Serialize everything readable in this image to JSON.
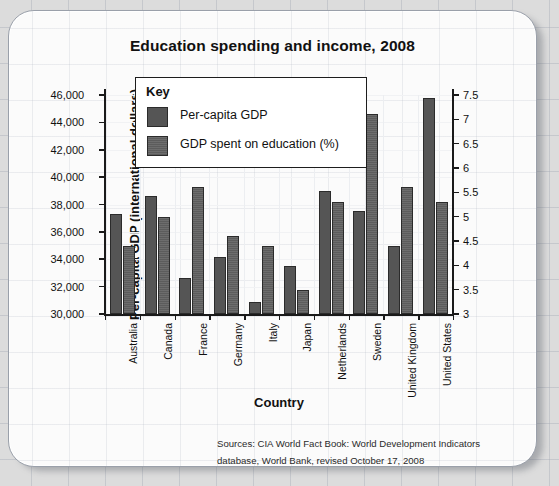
{
  "card": {
    "title": "Education spending and income, 2008"
  },
  "legend": {
    "title": "Key",
    "entries": [
      {
        "label": "Per-capita GDP",
        "swatch": "gdp",
        "color": "#555555"
      },
      {
        "label": "GDP spent on education (%)",
        "swatch": "edu",
        "color": "#5c5c5c"
      }
    ]
  },
  "sources": {
    "line1": "Sources: CIA World Fact Book: World Development Indicators",
    "line2": "database, World Bank, revised October 17, 2008"
  },
  "chart_data": {
    "type": "bar",
    "title": "Education spending and income, 2008",
    "xlabel": "Country",
    "ylabel": "Per-capita GDP (international dollars)",
    "y2label": "GDP spent on education (%)",
    "categories": [
      "Australia",
      "Canada",
      "France",
      "Germany",
      "Italy",
      "Japan",
      "Netherlands",
      "Sweden",
      "United Kingdom",
      "United States"
    ],
    "series": [
      {
        "name": "Per-capita GDP",
        "axis": "left",
        "color": "#555555",
        "values": [
          37300,
          38600,
          32600,
          34150,
          30900,
          33500,
          39000,
          37500,
          35000,
          45800
        ]
      },
      {
        "name": "GDP spent on education (%)",
        "axis": "right",
        "color": "#5c5c5c",
        "values": [
          4.4,
          5.0,
          5.6,
          4.6,
          4.4,
          3.5,
          5.3,
          7.1,
          5.6,
          5.3
        ]
      }
    ],
    "ylim": [
      30000,
      46000
    ],
    "yticks": [
      30000,
      32000,
      34000,
      36000,
      38000,
      40000,
      42000,
      44000,
      46000
    ],
    "yticklabels": [
      "30,000",
      "32,000",
      "34,000",
      "36,000",
      "38,000",
      "40,000",
      "42,000",
      "44,000",
      "46,000"
    ],
    "y2lim": [
      3,
      7.5
    ],
    "y2ticks": [
      3,
      3.5,
      4,
      4.5,
      5,
      5.5,
      6,
      6.5,
      7,
      7.5
    ],
    "y2ticklabels": [
      "3",
      "3.5",
      "4",
      "4.5",
      "5",
      "5.5",
      "6",
      "6.5",
      "7",
      "7.5"
    ],
    "grid": true,
    "legend_position": "upper-left-inside"
  }
}
